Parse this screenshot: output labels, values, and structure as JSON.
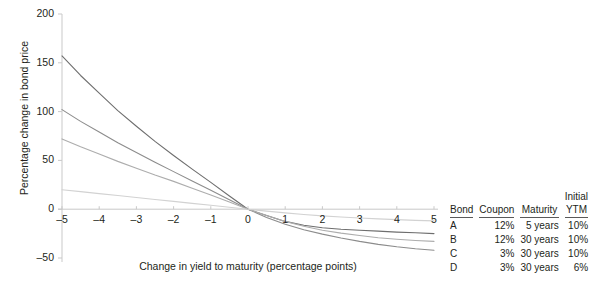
{
  "chart_data": {
    "type": "line",
    "title": "",
    "xlabel": "Change in yield to maturity (percentage points)",
    "ylabel": "Percentage change in bond price",
    "xlim": [
      -5,
      5
    ],
    "ylim": [
      -50,
      200
    ],
    "xticks": [
      "-5",
      "-4",
      "-3",
      "-2",
      "-1",
      "0",
      "1",
      "2",
      "3",
      "4",
      "5"
    ],
    "xtick_values": [
      -5,
      -4,
      -3,
      -2,
      -1,
      0,
      1,
      2,
      3,
      4,
      5
    ],
    "yticks": [
      "200",
      "150",
      "100",
      "50",
      "0",
      "-50"
    ],
    "ytick_values": [
      200,
      150,
      100,
      50,
      0,
      -50
    ],
    "grid": false,
    "legend_position": "right-table",
    "x": [
      -5,
      -4.5,
      -4,
      -3.5,
      -3,
      -2.5,
      -2,
      -1.5,
      -1,
      -0.5,
      0,
      0.5,
      1,
      1.5,
      2,
      2.5,
      3,
      3.5,
      4,
      4.5,
      5
    ],
    "series": [
      {
        "name": "A",
        "color": "#6e6e6e",
        "values": [
          157,
          137,
          119,
          101,
          85,
          69.5,
          55,
          41,
          27.5,
          13.5,
          0,
          -6.5,
          -12.5,
          -16.5,
          -19,
          -20.5,
          -21.5,
          -22.5,
          -23.5,
          -24.2,
          -25
        ]
      },
      {
        "name": "B",
        "color": "#8c8c8c",
        "values": [
          102,
          90,
          79,
          68,
          58,
          48,
          38.5,
          29,
          19.5,
          9.8,
          0,
          -8.5,
          -15.5,
          -21,
          -25.5,
          -29.5,
          -33,
          -36,
          -38.5,
          -40.5,
          -42
        ]
      },
      {
        "name": "C",
        "color": "#adadad",
        "values": [
          72,
          64,
          56.5,
          49,
          42,
          35,
          28.5,
          21.5,
          14.5,
          7.3,
          0,
          -6.5,
          -12.5,
          -17.5,
          -21.5,
          -24.5,
          -27,
          -29.2,
          -30.8,
          -32,
          -33
        ]
      },
      {
        "name": "D",
        "color": "#d2d2d2",
        "values": [
          20,
          18,
          16,
          14,
          12,
          10,
          8,
          6,
          4,
          2,
          0,
          -2,
          -3.8,
          -5.4,
          -6.8,
          -8,
          -9,
          -9.9,
          -10.7,
          -11.4,
          -12
        ]
      }
    ]
  },
  "legend": {
    "headers": {
      "bond": "Bond",
      "coupon": "Coupon",
      "maturity": "Maturity",
      "initial_ytm_line1": "Initial",
      "initial_ytm_line2": "YTM"
    },
    "rows": [
      {
        "bond": "A",
        "coupon": "12%",
        "maturity": "5 years",
        "ytm": "10%"
      },
      {
        "bond": "B",
        "coupon": "12%",
        "maturity": "30 years",
        "ytm": "10%"
      },
      {
        "bond": "C",
        "coupon": "3%",
        "maturity": "30 years",
        "ytm": "10%"
      },
      {
        "bond": "D",
        "coupon": "3%",
        "maturity": "30 years",
        "ytm": "6%"
      }
    ]
  },
  "style": {
    "axis_color": "#c9c9c9",
    "tick_color": "#c9c9c9",
    "text_color": "#231f20",
    "background": "#ffffff"
  }
}
